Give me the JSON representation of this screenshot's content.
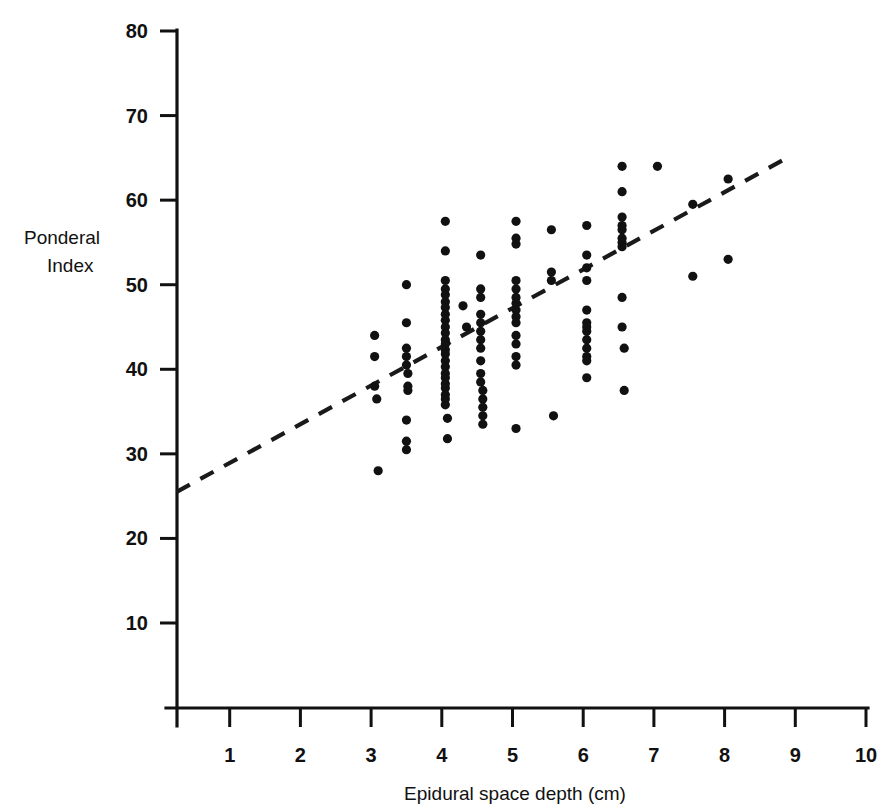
{
  "figure": {
    "background_color": "#ffffff",
    "ink_color": "#111111"
  },
  "chart_data": {
    "type": "scatter",
    "title": "",
    "subtitle": "",
    "xlabel": "Epidural space depth (cm)",
    "ylabel": "Ponderal Index",
    "ylabel_lines": [
      "Ponderal",
      "Index"
    ],
    "xlim": [
      0,
      10
    ],
    "ylim": [
      0,
      80
    ],
    "xticks": [
      1,
      2,
      3,
      4,
      5,
      6,
      7,
      8,
      9,
      10
    ],
    "xtick_labels": [
      "1",
      "2",
      "3",
      "4",
      "5",
      "6",
      "7",
      "8",
      "9",
      "10"
    ],
    "yticks": [
      10,
      20,
      30,
      40,
      50,
      60,
      70,
      80
    ],
    "ytick_labels": [
      "10",
      "20",
      "30",
      "40",
      "50",
      "60",
      "70",
      "80"
    ],
    "grid": false,
    "legend": null,
    "legend_position": "none",
    "marker": "filled-circle",
    "marker_size_px": 5,
    "point_color": "#111111",
    "annotations": [],
    "trend_line": {
      "style": "dashed",
      "label": "regression line",
      "color": "#1a1a1a",
      "x_start": 0.25,
      "y_start": 25.5,
      "x_end": 8.95,
      "y_end": 65.3
    },
    "points": [
      [
        3.05,
        44.0
      ],
      [
        3.05,
        41.5
      ],
      [
        3.05,
        38.0
      ],
      [
        3.08,
        36.5
      ],
      [
        3.1,
        28.0
      ],
      [
        3.5,
        50.0
      ],
      [
        3.5,
        45.5
      ],
      [
        3.5,
        42.5
      ],
      [
        3.5,
        41.5
      ],
      [
        3.5,
        40.5
      ],
      [
        3.52,
        39.5
      ],
      [
        3.52,
        38.0
      ],
      [
        3.52,
        37.5
      ],
      [
        3.5,
        34.0
      ],
      [
        3.5,
        31.5
      ],
      [
        3.5,
        30.5
      ],
      [
        4.05,
        57.5
      ],
      [
        4.05,
        54.0
      ],
      [
        4.05,
        50.5
      ],
      [
        4.05,
        49.5
      ],
      [
        4.05,
        48.8
      ],
      [
        4.05,
        48.0
      ],
      [
        4.05,
        47.3
      ],
      [
        4.05,
        46.5
      ],
      [
        4.05,
        45.8
      ],
      [
        4.05,
        45.0
      ],
      [
        4.05,
        44.3
      ],
      [
        4.05,
        43.5
      ],
      [
        4.05,
        43.0
      ],
      [
        4.05,
        42.3
      ],
      [
        4.05,
        41.8
      ],
      [
        4.05,
        41.0
      ],
      [
        4.05,
        40.3
      ],
      [
        4.05,
        39.5
      ],
      [
        4.05,
        39.0
      ],
      [
        4.05,
        38.3
      ],
      [
        4.05,
        37.8
      ],
      [
        4.05,
        37.0
      ],
      [
        4.05,
        36.5
      ],
      [
        4.05,
        35.8
      ],
      [
        4.08,
        34.2
      ],
      [
        4.08,
        31.8
      ],
      [
        4.3,
        47.5
      ],
      [
        4.35,
        45.0
      ],
      [
        4.55,
        53.5
      ],
      [
        4.55,
        49.5
      ],
      [
        4.55,
        48.5
      ],
      [
        4.55,
        46.5
      ],
      [
        4.55,
        45.5
      ],
      [
        4.55,
        44.5
      ],
      [
        4.55,
        43.5
      ],
      [
        4.55,
        42.5
      ],
      [
        4.55,
        41.0
      ],
      [
        4.55,
        39.5
      ],
      [
        4.55,
        38.5
      ],
      [
        4.58,
        37.5
      ],
      [
        4.58,
        36.5
      ],
      [
        4.58,
        35.5
      ],
      [
        4.58,
        34.5
      ],
      [
        4.58,
        33.5
      ],
      [
        5.05,
        57.5
      ],
      [
        5.05,
        55.5
      ],
      [
        5.05,
        54.8
      ],
      [
        5.05,
        50.5
      ],
      [
        5.05,
        49.5
      ],
      [
        5.05,
        48.5
      ],
      [
        5.05,
        47.8
      ],
      [
        5.05,
        47.0
      ],
      [
        5.05,
        46.2
      ],
      [
        5.05,
        45.5
      ],
      [
        5.05,
        44.0
      ],
      [
        5.05,
        43.0
      ],
      [
        5.05,
        41.5
      ],
      [
        5.05,
        40.5
      ],
      [
        5.05,
        33.0
      ],
      [
        5.55,
        56.5
      ],
      [
        5.55,
        51.5
      ],
      [
        5.55,
        50.5
      ],
      [
        5.58,
        34.5
      ],
      [
        6.05,
        57.0
      ],
      [
        6.05,
        53.5
      ],
      [
        6.05,
        52.0
      ],
      [
        6.05,
        50.5
      ],
      [
        6.05,
        47.0
      ],
      [
        6.05,
        45.5
      ],
      [
        6.05,
        45.0
      ],
      [
        6.05,
        44.5
      ],
      [
        6.05,
        43.5
      ],
      [
        6.05,
        42.5
      ],
      [
        6.05,
        41.5
      ],
      [
        6.05,
        41.0
      ],
      [
        6.05,
        39.0
      ],
      [
        6.55,
        64.0
      ],
      [
        6.55,
        61.0
      ],
      [
        6.55,
        58.0
      ],
      [
        6.55,
        57.0
      ],
      [
        6.55,
        56.5
      ],
      [
        6.55,
        55.5
      ],
      [
        6.55,
        55.0
      ],
      [
        6.55,
        54.5
      ],
      [
        6.55,
        48.5
      ],
      [
        6.55,
        45.0
      ],
      [
        6.58,
        42.5
      ],
      [
        6.58,
        37.5
      ],
      [
        7.05,
        64.0
      ],
      [
        7.55,
        59.5
      ],
      [
        7.55,
        51.0
      ],
      [
        8.05,
        62.5
      ],
      [
        8.05,
        53.0
      ]
    ]
  },
  "axes": {
    "x_axis_name": "x-axis",
    "y_axis_name": "y-axis"
  }
}
